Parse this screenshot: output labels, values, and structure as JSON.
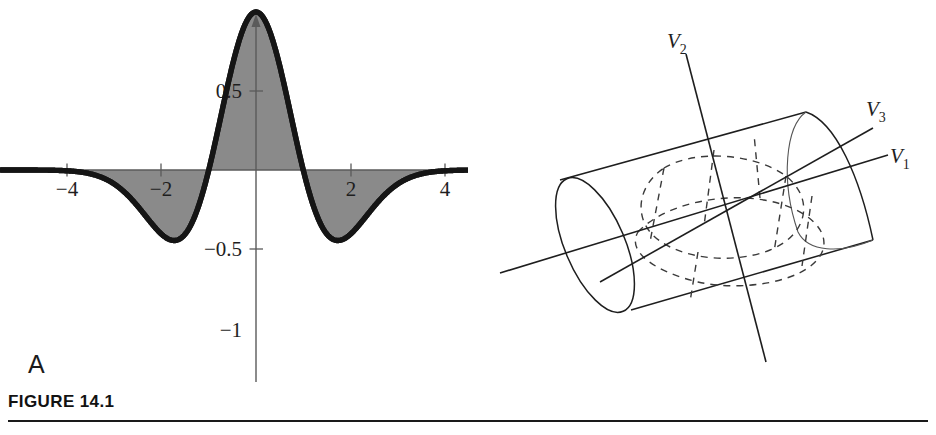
{
  "figure": {
    "caption": "FIGURE 14.1",
    "panels": [
      {
        "id": "A",
        "label": "A"
      },
      {
        "id": "B",
        "label": "B"
      }
    ]
  },
  "panel_a": {
    "name": "mexican-hat-wavelet-plot",
    "xticklabels": [
      "−4",
      "−2",
      "2",
      "4"
    ],
    "yticklabels": [
      "0.5",
      "−0.5",
      "−1"
    ],
    "shaded_fill": "#8a8a8a",
    "curve_color": "#151515",
    "axis_color": "#5a5a5a"
  },
  "panel_b": {
    "name": "cylinder-principal-axes-diagram",
    "axis_labels": [
      {
        "base": "V",
        "sub": "2"
      },
      {
        "base": "V",
        "sub": "3"
      },
      {
        "base": "V",
        "sub": "1"
      }
    ],
    "line_color": "#1e1e1e"
  },
  "chart_data": {
    "type": "line",
    "title": "",
    "subtitle": "",
    "xlabel": "",
    "ylabel": "",
    "xlim": [
      -5.4,
      5.4
    ],
    "ylim": [
      -1.12,
      0.62
    ],
    "grid": false,
    "legend": null,
    "function": "Mexican hat (Ricker) wavelet: y = (1 - x^2) * exp(-x^2/2)",
    "xticks": [
      -4,
      -2,
      2,
      4
    ],
    "yticks": [
      0.5,
      -0.5,
      -1
    ],
    "fill_between_zero": true,
    "series": [
      {
        "name": "wavelet",
        "x": [
          -5.4,
          -5.1,
          -4.8,
          -4.5,
          -4.2,
          -3.9,
          -3.6,
          -3.3,
          -3.0,
          -2.8,
          -2.6,
          -2.4,
          -2.2,
          -2.0,
          -1.8,
          -1.6,
          -1.4,
          -1.2,
          -1.0,
          -0.8,
          -0.6,
          -0.4,
          -0.2,
          0.0,
          0.2,
          0.4,
          0.6,
          0.8,
          1.0,
          1.2,
          1.4,
          1.6,
          1.8,
          2.0,
          2.2,
          2.4,
          2.6,
          2.8,
          3.0,
          3.3,
          3.6,
          3.9,
          4.2,
          4.5,
          4.8,
          5.1,
          5.4
        ],
        "y": [
          -0.0,
          -0.001,
          -0.002,
          -0.005,
          -0.011,
          -0.022,
          -0.04,
          -0.068,
          -0.089,
          -0.115,
          -0.141,
          -0.163,
          -0.177,
          -0.406,
          -0.206,
          -0.204,
          -0.33,
          -0.215,
          0.0,
          0.261,
          0.441,
          0.488,
          0.376,
          0.0,
          0.376,
          0.488,
          0.441,
          0.261,
          0.0,
          -0.215,
          -0.33,
          -0.204,
          -0.206,
          -0.406,
          -0.177,
          -0.163,
          -0.141,
          -0.115,
          -0.089,
          -0.068,
          -0.04,
          -0.022,
          -0.011,
          -0.005,
          -0.002,
          -0.001,
          -0.0
        ],
        "key_points": {
          "center_minimum": {
            "x": 0,
            "y": -1
          },
          "side_maxima": [
            {
              "x": -1.73,
              "y": 0.446
            },
            {
              "x": 1.73,
              "y": 0.446
            }
          ],
          "zero_crossings": [
            -1,
            1
          ]
        }
      }
    ]
  }
}
